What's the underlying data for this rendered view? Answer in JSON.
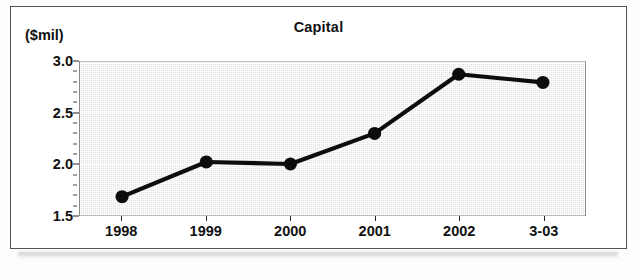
{
  "figure": {
    "title": "Capital",
    "y_axis_caption": "($mil)"
  },
  "chart_data": {
    "type": "line",
    "title": "Capital",
    "subtitle": "",
    "xlabel": "",
    "ylabel": "($mil)",
    "categories": [
      "1998",
      "1999",
      "2000",
      "2001",
      "2002",
      "3-03"
    ],
    "values": [
      1.68,
      2.02,
      2.0,
      2.3,
      2.88,
      2.8
    ],
    "series": [
      {
        "name": "Capital",
        "values": [
          1.68,
          2.02,
          2.0,
          2.3,
          2.88,
          2.8
        ]
      }
    ],
    "ylim": [
      1.5,
      3.0
    ],
    "ytick_labels": [
      "3.0",
      "2.5",
      "2.0",
      "1.5"
    ],
    "ytick_values": [
      3.0,
      2.5,
      2.0,
      1.5
    ],
    "yminor_step": 0.1,
    "xtick_labels": [
      "1998",
      "1999",
      "2000",
      "2001",
      "2002",
      "3-03"
    ],
    "grid": true,
    "legend": false,
    "legend_position": "none",
    "marker": "filled-circle",
    "line_color": "#0d0d0d",
    "marker_color": "#0d0d0d",
    "plot_background": "#e4e4e4",
    "annotations": []
  }
}
